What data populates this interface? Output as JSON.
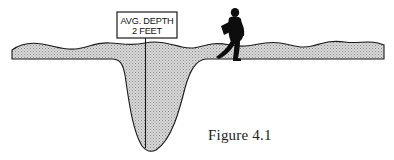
{
  "figure": {
    "caption": "Figure 4.1",
    "sign": {
      "line1": "AVG. DEPTH",
      "line2": "2 FEET"
    },
    "elements": [
      "water-body-cross-section",
      "depth-sign",
      "walking-person-silhouette"
    ]
  },
  "colors": {
    "water_fill": "#c9c9c9",
    "outline": "#1a1a1a",
    "background": "#ffffff"
  }
}
